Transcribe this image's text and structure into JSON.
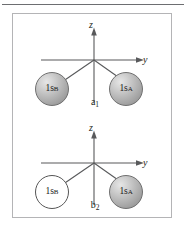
{
  "figure": {
    "panel_border_color": "#b4b4b6",
    "rule_color": "#6d6e71",
    "line_color": "#58595b",
    "filled_orbital_color": "#b9b9b9",
    "empty_orbital_color": "#ffffff"
  },
  "diagrams": [
    {
      "id": "a1",
      "symmetry_label": "a",
      "symmetry_subscript": "1",
      "axes": {
        "vertical_label": "z",
        "horizontal_label": "y"
      },
      "orbitals": [
        {
          "position": "left",
          "label": "1s",
          "subscript": "B",
          "fill": "filled"
        },
        {
          "position": "right",
          "label": "1s",
          "subscript": "A",
          "fill": "filled"
        }
      ]
    },
    {
      "id": "b2",
      "symmetry_label": "b",
      "symmetry_subscript": "2",
      "axes": {
        "vertical_label": "z",
        "horizontal_label": "y"
      },
      "orbitals": [
        {
          "position": "left",
          "label": "1s",
          "subscript": "B",
          "fill": "empty"
        },
        {
          "position": "right",
          "label": "1s",
          "subscript": "A",
          "fill": "filled"
        }
      ]
    }
  ]
}
